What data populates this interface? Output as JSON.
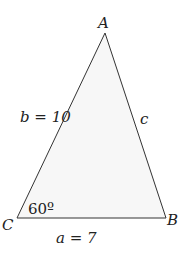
{
  "diagram": {
    "type": "triangle",
    "vertices": {
      "A": {
        "label": "A"
      },
      "B": {
        "label": "B"
      },
      "C": {
        "label": "C"
      }
    },
    "sides": {
      "a": {
        "label": "a = 7",
        "between": [
          "B",
          "C"
        ]
      },
      "b": {
        "label": "b = 10",
        "between": [
          "A",
          "C"
        ]
      },
      "c": {
        "label": "c",
        "between": [
          "A",
          "B"
        ]
      }
    },
    "angles": {
      "C": {
        "label": "60º"
      }
    },
    "colors": {
      "stroke": "#333333",
      "fill": "#f7f7f7",
      "text": "#222222"
    }
  }
}
